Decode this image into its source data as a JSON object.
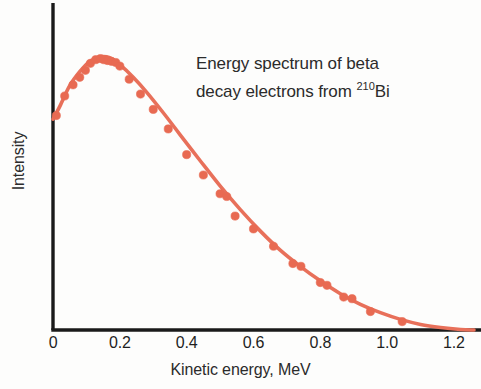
{
  "figure": {
    "background_color": "#fdfdfc",
    "axis_color": "#1a1a1a",
    "curve_color": "#e8705a",
    "marker_color": "#e86a52",
    "text_color": "#2b2b2b"
  },
  "annotation": {
    "line1": "Energy spectrum of beta",
    "line2_prefix": "decay electrons from ",
    "line2_superscript": "210",
    "line2_element": "Bi"
  },
  "chart_data": {
    "type": "scatter",
    "title": "Energy spectrum of beta decay electrons from 210Bi",
    "xlabel": "Kinetic energy, MeV",
    "ylabel": "Intensity",
    "xlim": [
      0,
      1.26
    ],
    "ylim": [
      0,
      1.06
    ],
    "grid": false,
    "legend": null,
    "xticks": [
      0,
      0.2,
      0.4,
      0.6,
      0.8,
      1.0,
      1.2
    ],
    "xtick_labels": [
      "0",
      "0.2",
      "0.4",
      "0.6",
      "0.8",
      "1.0",
      "1.2"
    ],
    "yticks": [],
    "ytick_labels": [],
    "series": [
      {
        "name": "fitted spectrum",
        "type": "line",
        "x": [
          0.0,
          0.02,
          0.05,
          0.08,
          0.11,
          0.14,
          0.17,
          0.2,
          0.24,
          0.28,
          0.33,
          0.38,
          0.44,
          0.5,
          0.56,
          0.62,
          0.68,
          0.74,
          0.8,
          0.86,
          0.92,
          0.98,
          1.04,
          1.1,
          1.16,
          1.22,
          1.26
        ],
        "y": [
          0.755,
          0.8,
          0.875,
          0.925,
          0.962,
          0.978,
          0.975,
          0.95,
          0.905,
          0.852,
          0.778,
          0.7,
          0.607,
          0.516,
          0.432,
          0.355,
          0.286,
          0.228,
          0.176,
          0.13,
          0.092,
          0.062,
          0.038,
          0.02,
          0.009,
          0.002,
          0.0
        ]
      },
      {
        "name": "measured data points",
        "type": "scatter",
        "x": [
          0.01,
          0.035,
          0.06,
          0.08,
          0.097,
          0.112,
          0.128,
          0.142,
          0.152,
          0.163,
          0.175,
          0.188,
          0.2,
          0.228,
          0.262,
          0.3,
          0.345,
          0.4,
          0.45,
          0.5,
          0.52,
          0.545,
          0.6,
          0.66,
          0.718,
          0.742,
          0.8,
          0.82,
          0.87,
          0.895,
          0.95,
          1.045
        ],
        "y": [
          0.768,
          0.838,
          0.878,
          0.905,
          0.93,
          0.955,
          0.968,
          0.972,
          0.968,
          0.965,
          0.962,
          0.958,
          0.945,
          0.898,
          0.845,
          0.79,
          0.72,
          0.628,
          0.555,
          0.488,
          0.478,
          0.408,
          0.362,
          0.3,
          0.238,
          0.228,
          0.17,
          0.16,
          0.118,
          0.112,
          0.066,
          0.03
        ]
      }
    ]
  },
  "axis_titles": {
    "x": "Kinetic energy, MeV",
    "y": "Intensity"
  }
}
